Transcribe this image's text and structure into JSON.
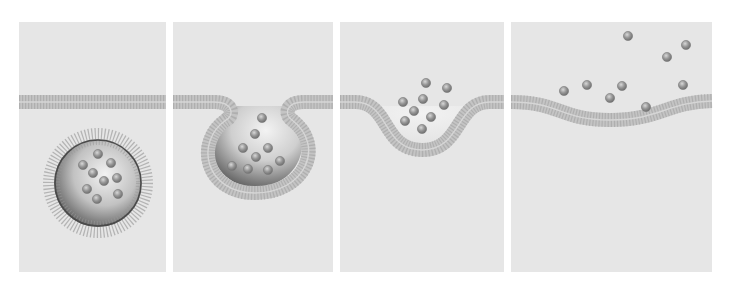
{
  "figure": {
    "title": "",
    "width": 729,
    "height": 291,
    "colors": {
      "background": "#ffffff",
      "panel": "#e6e6e6",
      "membrane_head": "#a8a8a8",
      "membrane_tail": "#b9b9b9",
      "membrane_band": "#c4c4c4",
      "particle_fill": "#8e8e8e",
      "particle_highlight": "#cfcfcf",
      "vesicle_inner_light": "#f0f0f0",
      "vesicle_inner_dark": "#6a6a6a",
      "vesicle_ring": "#4a4a4a"
    },
    "panels": [
      {
        "id": "stage-1-vesicle-approach",
        "x": 19,
        "y": 22,
        "w": 147,
        "h": 250,
        "membrane_y": 102,
        "membrane_type": "flat",
        "vesicle": {
          "cx": 98,
          "cy": 183,
          "r": 44
        },
        "particles": [
          [
            98,
            154
          ],
          [
            111,
            163
          ],
          [
            83,
            165
          ],
          [
            93,
            173
          ],
          [
            117,
            178
          ],
          [
            104,
            181
          ],
          [
            87,
            189
          ],
          [
            118,
            194
          ],
          [
            97,
            199
          ]
        ]
      },
      {
        "id": "stage-2-membrane-fusion",
        "x": 173,
        "y": 22,
        "w": 160,
        "h": 250,
        "membrane_y": 102,
        "membrane_type": "cup",
        "cup": {
          "left_x": 232,
          "right_x": 288,
          "cx": 253,
          "bottom_y": 193,
          "rx": 55
        },
        "particles": [
          [
            262,
            118
          ],
          [
            255,
            134
          ],
          [
            268,
            148
          ],
          [
            243,
            148
          ],
          [
            256,
            157
          ],
          [
            280,
            161
          ],
          [
            232,
            166
          ],
          [
            248,
            169
          ],
          [
            268,
            170
          ]
        ]
      },
      {
        "id": "stage-3-pore-opening",
        "x": 340,
        "y": 22,
        "w": 164,
        "h": 250,
        "membrane_y": 102,
        "membrane_type": "dip",
        "dip": {
          "start_x": 365,
          "end_x": 480,
          "cx": 422,
          "depth_y": 150
        },
        "particles": [
          [
            426,
            83
          ],
          [
            447,
            88
          ],
          [
            403,
            102
          ],
          [
            423,
            99
          ],
          [
            444,
            105
          ],
          [
            414,
            111
          ],
          [
            431,
            117
          ],
          [
            405,
            121
          ],
          [
            422,
            129
          ]
        ]
      },
      {
        "id": "stage-4-content-release",
        "x": 511,
        "y": 22,
        "w": 201,
        "h": 250,
        "membrane_y": 102,
        "membrane_type": "shallow",
        "shallow": {
          "start_x": 520,
          "end_x": 712,
          "cx": 610,
          "depth_y": 120
        },
        "particles": [
          [
            628,
            36
          ],
          [
            686,
            45
          ],
          [
            667,
            57
          ],
          [
            564,
            91
          ],
          [
            587,
            85
          ],
          [
            622,
            86
          ],
          [
            610,
            98
          ],
          [
            683,
            85
          ],
          [
            646,
            107
          ]
        ]
      }
    ]
  }
}
